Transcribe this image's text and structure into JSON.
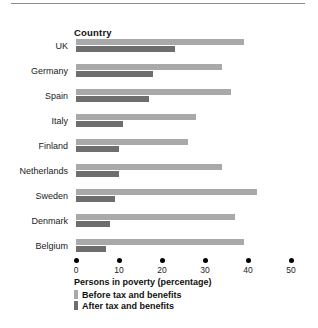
{
  "axis_heading": "Country",
  "caption": "Persons in poverty (percentage)",
  "legend": [
    {
      "label": "Before tax and benefits",
      "color": "#a9a9a9",
      "key": "before"
    },
    {
      "label": "After tax and benefits",
      "color": "#6e6e6e",
      "key": "after"
    }
  ],
  "colors": {
    "before": "#a9a9a9",
    "after": "#6e6e6e",
    "tick": "#000000",
    "rule": "#8c8c8c",
    "text": "#1a1a1a"
  },
  "chart_data": {
    "type": "bar",
    "orientation": "horizontal",
    "title": "",
    "subtitle": "",
    "xlabel": "Persons in poverty (percentage)",
    "ylabel": "Country",
    "xlim": [
      0,
      50
    ],
    "xticks": [
      0,
      10,
      20,
      30,
      40,
      50
    ],
    "xtick_labels": [
      "0",
      "10",
      "20",
      "30",
      "40",
      "50"
    ],
    "grid": false,
    "legend_position": "below-axis",
    "categories": [
      "UK",
      "Germany",
      "Spain",
      "Italy",
      "Finland",
      "Netherlands",
      "Sweden",
      "Denmark",
      "Belgium"
    ],
    "series": [
      {
        "name": "Before tax and benefits",
        "color": "#a9a9a9",
        "values": [
          39,
          34,
          36,
          28,
          26,
          34,
          42,
          37,
          39
        ]
      },
      {
        "name": "After tax and benefits",
        "color": "#6e6e6e",
        "values": [
          23,
          18,
          17,
          11,
          10,
          10,
          9,
          8,
          7
        ]
      }
    ]
  }
}
